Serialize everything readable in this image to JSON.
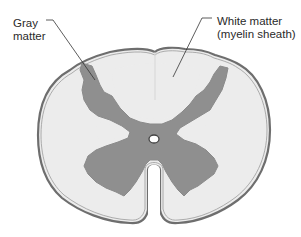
{
  "diagram": {
    "labels": [
      {
        "id": "gray-matter",
        "line1": "Gray",
        "line2": "matter"
      },
      {
        "id": "white-matter",
        "line1": "White matter",
        "line2": "(myelin sheath)"
      }
    ],
    "colors": {
      "background": "#ffffff",
      "white_matter": "#ececec",
      "gray_matter": "#8f8f8f",
      "outline": "#6e6e6e",
      "leader_line": "#333333",
      "text": "#2a2a2a"
    }
  }
}
